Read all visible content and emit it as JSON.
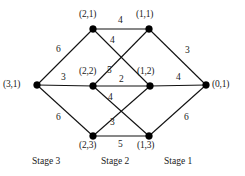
{
  "figure": {
    "type": "network-graph",
    "width": 245,
    "height": 176,
    "background": "#ffffff",
    "line_color": "#111111",
    "node_color": "#000000"
  },
  "nodes": [
    {
      "id": "3-1",
      "label": "(3,1)",
      "x": 37,
      "y": 85,
      "label_x": 3,
      "label_y": 80
    },
    {
      "id": "2-1",
      "label": "(2,1)",
      "x": 93,
      "y": 29,
      "label_x": 79,
      "label_y": 10
    },
    {
      "id": "2-2",
      "label": "(2,2)",
      "x": 93,
      "y": 86,
      "label_x": 79,
      "label_y": 67
    },
    {
      "id": "2-3",
      "label": "(2,3)",
      "x": 93,
      "y": 136,
      "label_x": 79,
      "label_y": 141
    },
    {
      "id": "1-1",
      "label": "(1,1)",
      "x": 149,
      "y": 29,
      "label_x": 136,
      "label_y": 10
    },
    {
      "id": "1-2",
      "label": "(1,2)",
      "x": 150,
      "y": 86,
      "label_x": 137,
      "label_y": 67
    },
    {
      "id": "1-3",
      "label": "(1,3)",
      "x": 149,
      "y": 136,
      "label_x": 137,
      "label_y": 141
    },
    {
      "id": "0-1",
      "label": "(0,1)",
      "x": 206,
      "y": 85,
      "label_x": 212,
      "label_y": 80
    }
  ],
  "edges": [
    {
      "id": "e-31-21",
      "from": "3-1",
      "to": "2-1",
      "weight": "6",
      "label_x": 56,
      "label_y": 45
    },
    {
      "id": "e-31-22",
      "from": "3-1",
      "to": "2-2",
      "weight": "3",
      "label_x": 61,
      "label_y": 73
    },
    {
      "id": "e-31-23",
      "from": "3-1",
      "to": "2-3",
      "weight": "6",
      "label_x": 56,
      "label_y": 113
    },
    {
      "id": "e-21-11",
      "from": "2-1",
      "to": "1-1",
      "weight": "4",
      "label_x": 118,
      "label_y": 16
    },
    {
      "id": "e-21-12",
      "from": "2-1",
      "to": "1-2",
      "weight": "4",
      "label_x": 110,
      "label_y": 36
    },
    {
      "id": "e-22-11",
      "from": "2-2",
      "to": "1-1",
      "weight": "5",
      "label_x": 107,
      "label_y": 66
    },
    {
      "id": "e-22-12",
      "from": "2-2",
      "to": "1-2",
      "weight": "2",
      "label_x": 119,
      "label_y": 75
    },
    {
      "id": "e-22-13",
      "from": "2-2",
      "to": "1-3",
      "weight": "4",
      "label_x": 108,
      "label_y": 93
    },
    {
      "id": "e-23-12",
      "from": "2-3",
      "to": "1-2",
      "weight": "3",
      "label_x": 110,
      "label_y": 118
    },
    {
      "id": "e-23-13",
      "from": "2-3",
      "to": "1-3",
      "weight": "5",
      "label_x": 118,
      "label_y": 140
    },
    {
      "id": "e-11-01",
      "from": "1-1",
      "to": "0-1",
      "weight": "3",
      "label_x": 185,
      "label_y": 46
    },
    {
      "id": "e-12-01",
      "from": "1-2",
      "to": "0-1",
      "weight": "4",
      "label_x": 176,
      "label_y": 73
    },
    {
      "id": "e-13-01",
      "from": "1-3",
      "to": "0-1",
      "weight": "6",
      "label_x": 184,
      "label_y": 113
    }
  ],
  "stages": [
    {
      "id": "stage-3",
      "label": "Stage 3",
      "x": 32,
      "y": 157
    },
    {
      "id": "stage-2",
      "label": "Stage 2",
      "x": 101,
      "y": 157
    },
    {
      "id": "stage-1",
      "label": "Stage 1",
      "x": 164,
      "y": 157
    }
  ],
  "chart_data": {
    "type": "diagram",
    "title": "",
    "node_ids": [
      "(3,1)",
      "(2,1)",
      "(2,2)",
      "(2,3)",
      "(1,1)",
      "(1,2)",
      "(1,3)",
      "(0,1)"
    ],
    "edge_list": [
      [
        "(3,1)",
        "(2,1)",
        6
      ],
      [
        "(3,1)",
        "(2,2)",
        3
      ],
      [
        "(3,1)",
        "(2,3)",
        6
      ],
      [
        "(2,1)",
        "(1,1)",
        4
      ],
      [
        "(2,1)",
        "(1,2)",
        4
      ],
      [
        "(2,2)",
        "(1,1)",
        5
      ],
      [
        "(2,2)",
        "(1,2)",
        2
      ],
      [
        "(2,2)",
        "(1,3)",
        4
      ],
      [
        "(2,3)",
        "(1,2)",
        3
      ],
      [
        "(2,3)",
        "(1,3)",
        5
      ],
      [
        "(1,1)",
        "(0,1)",
        3
      ],
      [
        "(1,2)",
        "(0,1)",
        4
      ],
      [
        "(1,3)",
        "(0,1)",
        6
      ]
    ],
    "stage_labels": [
      "Stage 3",
      "Stage 2",
      "Stage 1"
    ]
  }
}
